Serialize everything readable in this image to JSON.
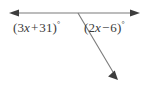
{
  "figure": {
    "background_color": "#ffffff",
    "line_color": "#7b7b7b",
    "text_color": "#3a3a3a",
    "width": 147,
    "height": 94
  },
  "labels": {
    "left_angle": {
      "full_text": "(3x + 31)°",
      "open_paren": "(",
      "coefficient": "3",
      "variable": "x",
      "operator": "+",
      "constant": "31",
      "close_paren": ")",
      "degree_symbol": "°"
    },
    "right_angle": {
      "full_text": "(2x − 6)°",
      "open_paren": "(",
      "coefficient": "2",
      "variable": "x",
      "operator": "−",
      "constant": "6",
      "close_paren": ")",
      "degree_symbol": "°"
    }
  },
  "geometry": {
    "horizontal_line": {
      "name": "horizontal-line-with-double-arrow",
      "x1": 10,
      "y1": 13,
      "x2": 139,
      "y2": 13
    },
    "diagonal_ray": {
      "name": "diagonal-ray-with-arrow",
      "x1": 78,
      "y1": 13,
      "x2": 117,
      "y2": 79
    },
    "vertex": {
      "x": 78,
      "y": 13
    },
    "arrow_left_tip": {
      "x": 9,
      "y": 13
    },
    "arrow_right_tip": {
      "x": 140,
      "y": 13
    },
    "arrow_diagonal_tip": {
      "x": 118,
      "y": 80
    }
  }
}
